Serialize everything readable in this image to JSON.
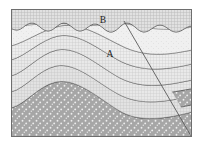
{
  "figure": {
    "frame": {
      "x": 11,
      "y": 9,
      "width": 181,
      "height": 128,
      "border_color": "#6e6e6e",
      "background_color": "#ffffff"
    },
    "labels": [
      {
        "id": "label-b",
        "text": "B",
        "x": 103,
        "y": 21,
        "unit": "upper-flat-lying-bed"
      },
      {
        "id": "label-a",
        "text": "A",
        "x": 110,
        "y": 55,
        "unit": "folded-core-bed"
      }
    ],
    "structures": {
      "unconformity": {
        "name": "wavy-erosional-unconformity",
        "description": "scalloped boundary separating upper flat bed B from folded beds below",
        "color": "#4a4a4a"
      },
      "fold": {
        "name": "anticline",
        "description": "concentric folded beds arching upward near center-left"
      },
      "fault": {
        "name": "normal-fault",
        "description": "diagonal line from upper-left to lower-right offsetting the folded beds",
        "start_x": 124,
        "start_y": 21,
        "end_x": 191,
        "end_y": 136,
        "color": "#555555"
      }
    },
    "layers": [
      {
        "id": "bed-b-top",
        "label": "B",
        "fill": "#c9c9c9",
        "pattern": "fine-grid",
        "order": 1
      },
      {
        "id": "bed-1",
        "label": "",
        "fill": "#d8d8d8",
        "pattern": "fine-grid",
        "order": 2
      },
      {
        "id": "bed-2",
        "label": "",
        "fill": "#cfcfcf",
        "pattern": "fine-grid",
        "order": 3
      },
      {
        "id": "bed-a-core",
        "label": "A",
        "fill": "#ebebeb",
        "pattern": "stipple-light",
        "order": 4
      },
      {
        "id": "bed-3",
        "label": "",
        "fill": "#d2d2d2",
        "pattern": "fine-grid",
        "order": 5
      },
      {
        "id": "bed-4",
        "label": "",
        "fill": "#c6c6c6",
        "pattern": "fine-grid",
        "order": 6
      },
      {
        "id": "bed-conglomerate",
        "label": "",
        "fill": "#a8a8a8",
        "pattern": "white-dot-stipple",
        "order": 7
      },
      {
        "id": "bed-basal",
        "label": "",
        "fill": "#d5d5d5",
        "pattern": "fine-grid",
        "order": 8
      }
    ]
  }
}
